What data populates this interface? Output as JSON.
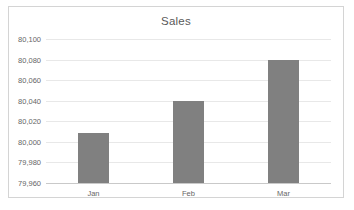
{
  "chart_data": {
    "type": "bar",
    "title": "Sales",
    "xlabel": "",
    "ylabel": "",
    "categories": [
      "Jan",
      "Feb",
      "Mar"
    ],
    "values": [
      80009,
      80040,
      80080
    ],
    "ylim": [
      79960,
      80100
    ],
    "ytick_step": 20,
    "ytick_labels": [
      "79,960",
      "79,980",
      "80,000",
      "80,020",
      "80,040",
      "80,060",
      "80,080",
      "80,100"
    ],
    "ytick_values": [
      79960,
      79980,
      80000,
      80020,
      80040,
      80060,
      80080,
      80100
    ],
    "grid": true,
    "legend": false,
    "legend_position": "none",
    "series": [
      {
        "name": "Sales",
        "values": [
          80009,
          80040,
          80080
        ]
      }
    ],
    "colors": {
      "bar": "#808080",
      "gridline": "#e8e8e8",
      "axis": "#c9c9c9",
      "title_text": "#595959",
      "tick_text": "#666666",
      "border": "#d4d4d4",
      "background": "#ffffff"
    }
  }
}
